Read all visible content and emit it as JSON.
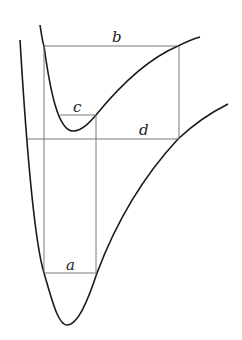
{
  "diagram": {
    "labels": {
      "a": "a",
      "b": "b",
      "c": "c",
      "d": "d"
    },
    "colors": {
      "curve": "#1a1a1a",
      "guide": "#6a6a6a",
      "background": "#ffffff"
    }
  }
}
